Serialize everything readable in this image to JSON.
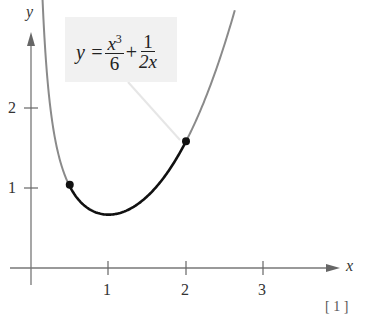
{
  "chart_data": {
    "type": "line",
    "title": "",
    "function": "y = x^3/6 + 1/(2x)",
    "annotation": {
      "lhs": "y =",
      "term1_num": "x",
      "term1_num_exp": "3",
      "term1_den": "6",
      "plus": "+",
      "term2_num": "1",
      "term2_den": "2x"
    },
    "xlabel": "x",
    "ylabel": "y",
    "x_ticks": [
      "1",
      "2",
      "3"
    ],
    "y_ticks": [
      "1",
      "2"
    ],
    "xlim": [
      -0.4,
      4.0
    ],
    "ylim": [
      -0.3,
      3.2
    ],
    "highlighted_interval": [
      0.5,
      2
    ],
    "points": [
      {
        "x": 0.5,
        "y": 1.0417
      },
      {
        "x": 2,
        "y": 1.5833
      }
    ],
    "series": [
      {
        "name": "curve (gray)",
        "x": [
          0.13,
          0.2,
          0.3,
          0.4,
          0.5
        ],
        "values": [
          3.85,
          2.5,
          1.67,
          1.26,
          1.04
        ]
      },
      {
        "name": "arc (black, 0.5 to 2)",
        "x": [
          0.5,
          0.75,
          1.0,
          1.25,
          1.5,
          1.75,
          2.0
        ],
        "values": [
          1.04,
          0.74,
          0.67,
          0.73,
          0.9,
          1.18,
          1.58
        ]
      },
      {
        "name": "curve (gray)",
        "x": [
          2.0,
          2.25,
          2.5,
          2.65
        ],
        "values": [
          1.58,
          2.12,
          2.8,
          3.29
        ]
      }
    ],
    "grid": false,
    "legend": null
  },
  "footer_fragment": "[ 1 ]"
}
